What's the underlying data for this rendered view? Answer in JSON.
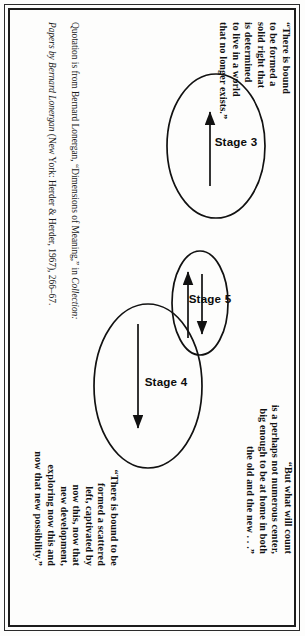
{
  "page": {
    "orientation": "rotated-90",
    "background": "#fdfdfc",
    "ink": "#111111"
  },
  "quotes": [
    {
      "id": "quote-upper-left",
      "text": "“There is bound\nto be formed a\nsolid right that\nis determined\nto live in a world\nthat no longer exists.”"
    },
    {
      "id": "quote-upper-right",
      "text": "“But what will count\nis a perhaps not numerous center,\nbig enough to be at home in both\nthe old and the new . . .”"
    },
    {
      "id": "quote-lower-right",
      "text": "“There is bound to be\nformed a scattered\nleft, captivated by\nnow this, now that\nnew development,\nexploring now this and\nnow that new possibility.”"
    }
  ],
  "citation": {
    "line1_part1": "Quotation is from Bernard Lonergan, “Dimensions of Meaning,” in ",
    "line1_italic": "Collection:",
    "line2_italic": "Papers by Bernard Lonergan",
    "line2_part2": " (New York: Herder & Herder, 1967), 266–67."
  },
  "diagram": {
    "type": "venn-stage-diagram",
    "stroke": "#111111",
    "fill": "none",
    "ellipses": [
      {
        "label": "Stage 3",
        "cx": 138,
        "cy": 82,
        "rx": 72,
        "ry": 49
      },
      {
        "label": "Stage 4",
        "cx": 378,
        "cy": 150,
        "rx": 82,
        "ry": 54
      },
      {
        "label": "Stage 5",
        "cx": 295,
        "cy": 98,
        "rx": 52,
        "ry": 28
      }
    ],
    "arrows": [
      {
        "id": "arrow-stage3",
        "direction": "up",
        "note": "inside Stage 3"
      },
      {
        "id": "arrow-stage5-a",
        "direction": "down",
        "note": "inside Stage 5"
      },
      {
        "id": "arrow-stage5-b",
        "direction": "up",
        "note": "inside Stage 5"
      },
      {
        "id": "arrow-stage4",
        "direction": "down",
        "note": "inside Stage 4"
      }
    ]
  }
}
